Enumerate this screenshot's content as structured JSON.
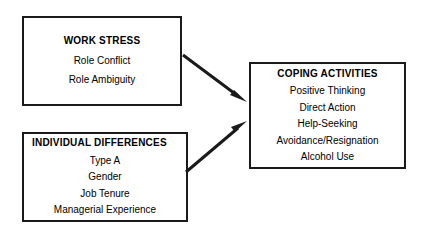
{
  "diagram": {
    "background_color": "#ffffff",
    "line_color": "#1a1a1a",
    "nodes": [
      {
        "id": "work-stress",
        "title": "WORK STRESS",
        "title_align": "center",
        "items": [
          "Role Conflict",
          "Role Ambiguity"
        ]
      },
      {
        "id": "individual-differences",
        "title": "INDIVIDUAL DIFFERENCES",
        "title_align": "left",
        "items": [
          "Type A",
          "Gender",
          "Job Tenure",
          "Managerial Experience"
        ]
      },
      {
        "id": "coping-activities",
        "title": "COPING ACTIVITIES",
        "title_align": "center",
        "items": [
          "Positive Thinking",
          "Direct Action",
          "Help-Seeking",
          "Avoidance/Resignation",
          "Alcohol Use"
        ]
      }
    ],
    "arrows": [
      {
        "id": "work-stress-to-coping",
        "from": "work-stress",
        "to": "coping-activities",
        "direction": "down-right"
      },
      {
        "id": "individual-differences-to-coping",
        "from": "individual-differences",
        "to": "coping-activities",
        "direction": "up-right"
      }
    ]
  }
}
